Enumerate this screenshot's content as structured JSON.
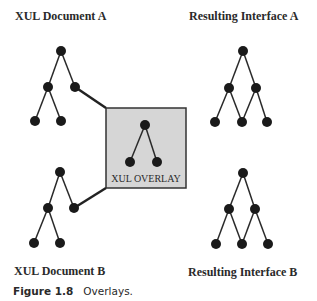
{
  "labels": {
    "doc_a": "XUL Document A",
    "doc_b": "XUL Document B",
    "result_a": "Resulting Interface A",
    "result_b": "Resulting Interface B",
    "overlay": "XUL OVERLAY"
  },
  "caption": {
    "figure": "Figure 1.8",
    "text": "Overlays."
  },
  "colors": {
    "node": "#1a1a1a",
    "edge": "#2a2a2a",
    "overlay_fill": "#d6d6d6",
    "overlay_border": "#333333"
  },
  "trees": {
    "document_a": {
      "nodes": 5,
      "structure": "root -> 2 children; left child -> 2 leaves; right child linked to overlay"
    },
    "document_b": {
      "nodes": 5,
      "structure": "root -> 2 children; left child -> 2 leaves; right child linked to overlay"
    },
    "overlay": {
      "nodes": 3,
      "structure": "root -> 2 leaves"
    },
    "result_a": {
      "nodes": 6,
      "structure": "root -> 2 children; 3 leaves shared (middle leaf has two parents)"
    },
    "result_b": {
      "nodes": 6,
      "structure": "root -> 2 children; 3 leaves shared (middle leaf has two parents)"
    }
  }
}
